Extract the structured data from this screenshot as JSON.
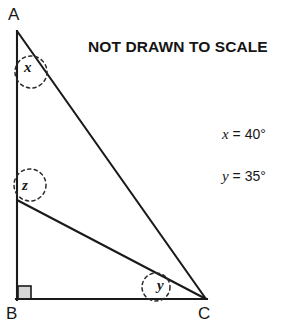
{
  "figure": {
    "note": "NOT DRAWN TO SCALE",
    "vertices": [
      {
        "id": "A",
        "label": "A",
        "x": 17,
        "y": 31
      },
      {
        "id": "B",
        "label": "B",
        "x": 17,
        "y": 299
      },
      {
        "id": "C",
        "label": "C",
        "x": 206,
        "y": 299
      },
      {
        "id": "D",
        "label": "",
        "x": 17,
        "y": 200
      }
    ],
    "segments": [
      {
        "name": "segment-AB",
        "from": "A",
        "to": "B"
      },
      {
        "name": "segment-BC",
        "from": "B",
        "to": "C"
      },
      {
        "name": "segment-AC",
        "from": "A",
        "to": "C"
      },
      {
        "name": "segment-DC",
        "from": "D",
        "to": "C"
      }
    ],
    "angle_markers": [
      {
        "name": "angle-x",
        "label": "x",
        "cx": 31,
        "cy": 72,
        "r": 16,
        "style": "dashed-circle"
      },
      {
        "name": "angle-z",
        "label": "z",
        "cx": 30,
        "cy": 185,
        "r": 16,
        "style": "dashed-circle"
      },
      {
        "name": "angle-y",
        "label": "y",
        "cx": 156,
        "cy": 287,
        "r": 14,
        "style": "dashed-circle"
      }
    ],
    "right_angle": {
      "name": "right-angle-marker-B",
      "vertex": "B",
      "size": 13,
      "fill": "#d6d6d6",
      "stroke": "#1a1a1a"
    },
    "given": [
      {
        "name": "given-x",
        "variable": "x",
        "equals": "=",
        "value": "40°",
        "text": "x = 40°"
      },
      {
        "name": "given-y",
        "variable": "y",
        "equals": "=",
        "value": "35°",
        "text": "y = 35°"
      }
    ],
    "colors": {
      "background": "#ffffff",
      "line": "#1a1a1a",
      "text": "#171717",
      "right_angle_fill": "#d6d6d6",
      "dash_marker": "#2b2b2b"
    }
  }
}
